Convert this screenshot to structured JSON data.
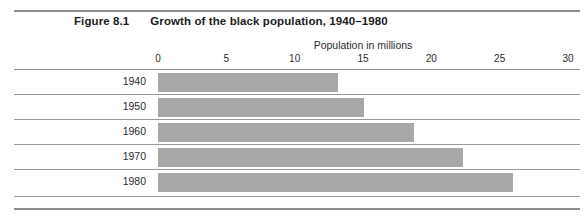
{
  "figure": {
    "number_label": "Figure 8.1",
    "title": "Growth of the black population, 1940–1980"
  },
  "chart_data": {
    "type": "bar",
    "orientation": "horizontal",
    "title": "Growth of the black population, 1940–1980",
    "subtitle": "Figure 8.1",
    "xlabel": "Population in millions",
    "ylabel": "",
    "categories": [
      "1940",
      "1950",
      "1960",
      "1970",
      "1980"
    ],
    "values": [
      13.2,
      15.1,
      18.7,
      22.3,
      26.0
    ],
    "xlim": [
      0,
      30
    ],
    "xticks": [
      0,
      5,
      10,
      15,
      20,
      25,
      30
    ],
    "xtick_labels": [
      "0",
      "5",
      "10",
      "15",
      "20",
      "25",
      "30"
    ],
    "grid": false,
    "legend": null,
    "bar_color": "#a8a8a8",
    "series": [
      {
        "name": "Black population (millions)",
        "values": [
          13.2,
          15.1,
          18.7,
          22.3,
          26.0
        ]
      }
    ]
  },
  "axis": {
    "title": "Population in millions",
    "ticks": [
      {
        "label": "0",
        "value": 0
      },
      {
        "label": "5",
        "value": 5
      },
      {
        "label": "10",
        "value": 10
      },
      {
        "label": "15",
        "value": 15
      },
      {
        "label": "20",
        "value": 20
      },
      {
        "label": "25",
        "value": 25
      },
      {
        "label": "30",
        "value": 30
      }
    ]
  },
  "rows": [
    {
      "label": "1940",
      "value": 13.2
    },
    {
      "label": "1950",
      "value": 15.1
    },
    {
      "label": "1960",
      "value": 18.7
    },
    {
      "label": "1970",
      "value": 22.3
    },
    {
      "label": "1980",
      "value": 26.0
    }
  ],
  "colors": {
    "bar": "#a8a8a8",
    "rule": "#9a9a9a",
    "heavy_rule": "#8e8e8e",
    "text": "#1c1c1c",
    "background": "#ffffff"
  }
}
